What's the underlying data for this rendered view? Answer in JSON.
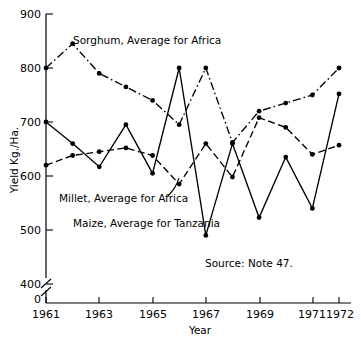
{
  "chart_data": {
    "type": "line",
    "title": "",
    "xlabel": "Year",
    "ylabel": "Yield Kg./Ha.",
    "x": [
      1961,
      1962,
      1963,
      1964,
      1965,
      1966,
      1967,
      1968,
      1969,
      1970,
      1971,
      1972
    ],
    "xticklabels": [
      "1961",
      "1963",
      "1965",
      "1967",
      "1969",
      "1971",
      "1972"
    ],
    "xtickvalues": [
      1961,
      1963,
      1965,
      1967,
      1969,
      1971,
      1972
    ],
    "yticklabels": [
      "900",
      "800",
      "700",
      "600",
      "500",
      "400",
      "0"
    ],
    "ytickvalues": [
      900,
      800,
      700,
      600,
      500,
      400,
      0
    ],
    "ylim": [
      400,
      900
    ],
    "xlim": [
      1961,
      1972
    ],
    "axis_break": true,
    "grid": false,
    "legend": "inline-annotations",
    "series": [
      {
        "name": "Sorghum, Average for Africa",
        "style": "dash-dot",
        "color": "#000000",
        "marker": "filled-circle",
        "values": [
          800,
          845,
          790,
          765,
          740,
          695,
          800,
          662,
          720,
          735,
          750,
          800
        ]
      },
      {
        "name": "Millet, Average for Africa",
        "style": "dashed",
        "color": "#000000",
        "marker": "filled-circle",
        "values": [
          620,
          638,
          645,
          652,
          638,
          585,
          660,
          598,
          708,
          690,
          640,
          657
        ]
      },
      {
        "name": "Maize, Average for Tanzania",
        "style": "solid",
        "color": "#000000",
        "marker": "filled-circle",
        "values": [
          700,
          660,
          617,
          695,
          605,
          800,
          490,
          660,
          523,
          635,
          540,
          752
        ]
      }
    ],
    "annotations": [
      {
        "id": "sorghum-label",
        "text": "Sorghum, Average for Africa",
        "x": 73,
        "y": 44
      },
      {
        "id": "millet-label",
        "text": "Millet, Average for Africa",
        "x": 59,
        "y": 202
      },
      {
        "id": "maize-label",
        "text": "Maize, Average for Tanzania",
        "x": 73,
        "y": 227
      },
      {
        "id": "source-note",
        "text": "Source: Note 47.",
        "x": 205,
        "y": 267
      }
    ]
  },
  "axes": {
    "y_title": "Yield Kg./Ha.",
    "x_title": "Year",
    "y_ticks": [
      {
        "label": "900",
        "y": 14
      },
      {
        "label": "800",
        "y": 68
      },
      {
        "label": "700",
        "y": 122
      },
      {
        "label": "600",
        "y": 176
      },
      {
        "label": "500",
        "y": 230
      },
      {
        "label": "400",
        "y": 284
      },
      {
        "label": "0",
        "y": 299
      }
    ],
    "x_ticks": [
      {
        "label": "1961",
        "x": 46
      },
      {
        "label": "1963",
        "x": 99
      },
      {
        "label": "1965",
        "x": 153
      },
      {
        "label": "1967",
        "x": 206
      },
      {
        "label": "1969",
        "x": 260
      },
      {
        "label": "1971",
        "x": 313
      },
      {
        "label": "1972",
        "x": 339
      }
    ]
  },
  "source": {
    "text": "Source: Note 47."
  }
}
